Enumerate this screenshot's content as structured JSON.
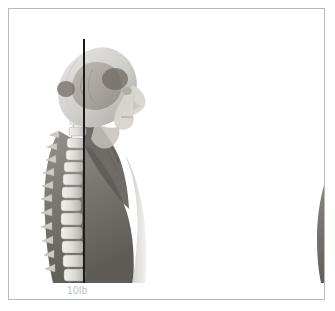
{
  "figure": {
    "border_color": "#b9b9b9",
    "background_color": "#ffffff",
    "plumb_line_color": "#1b1b1b",
    "label_color": "#bdbdbd"
  },
  "panels": [
    {
      "id": "upright",
      "label": "10lb",
      "posture": "neutral-upright-head-posture",
      "plumb_line_name": "vertical-plumb-line"
    },
    {
      "id": "forward",
      "label": "40lb",
      "posture": "forward-head-posture",
      "plumb_line_name": "vertical-plumb-line"
    }
  ],
  "illustration": {
    "view": "sagittal-lateral",
    "subject": "head-neck-and-upper-spine-anatomy",
    "structures": [
      "brain",
      "skull",
      "facial-profile",
      "cervical-vertebrae",
      "thoracic-vertebrae",
      "neck-musculature",
      "trapezius-muscle",
      "scapula",
      "shoulder-and-torso"
    ]
  }
}
